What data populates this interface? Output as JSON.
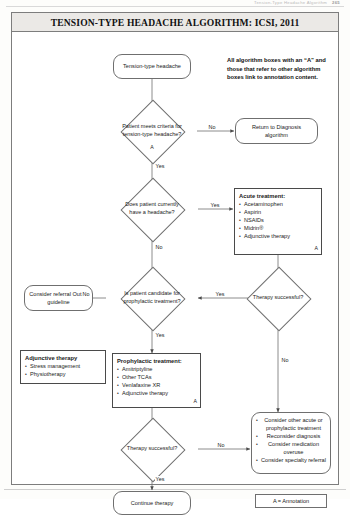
{
  "running_head": {
    "text": "Tension-Type Headache Algorithm",
    "page": "265"
  },
  "figure": {
    "title": "TENSION-TYPE HEADACHE ALGORITHM: ICSI, 2011",
    "note": "All algorithm boxes with an “A” and those that refer to other algorithm boxes link to annotation content.",
    "legend": "A = Annotation"
  },
  "nodes": {
    "start": {
      "label": "Tension-type headache"
    },
    "criteria": {
      "label": "Patient meets criteria for tension-type headache?",
      "annotation": "A"
    },
    "return_diagnosis": {
      "label": "Return to Diagnosis algorithm"
    },
    "current_headache": {
      "label": "Does patient currently have a headache?"
    },
    "acute_treatment": {
      "title": "Acute treatment:",
      "items": [
        "Acetaminophen",
        "Aspirin",
        "NSAIDs",
        "Midrin®",
        "Adjunctive therapy"
      ],
      "annotation": "A"
    },
    "therapy_success_upper": {
      "label": "Therapy successful?"
    },
    "prophylactic_candidate": {
      "label": "Is patient candidate for prophylactic treatment?"
    },
    "consider_referral": {
      "label": "Consider referral Out of guideline"
    },
    "adjunctive_therapy": {
      "title": "Adjunctive therapy",
      "items": [
        "Stress management",
        "Physiotherapy"
      ]
    },
    "prophylactic_treatment": {
      "title": "Prophylactic treatment:",
      "items": [
        "Amitriptyline",
        "Other TCAs",
        "Venlafaxine XR",
        "Adjunctive therapy"
      ],
      "annotation": "A"
    },
    "therapy_success_lower": {
      "label": "Therapy successful?"
    },
    "consider_other": {
      "items": [
        "Consider other acute or prophylactic treatment",
        "Reconsider diagnosis",
        "Consider medication overuse",
        "Consider specialty referral"
      ]
    },
    "continue_therapy": {
      "label": "Continue therapy"
    }
  },
  "edges": {
    "criteria_no": "No",
    "criteria_yes": "Yes",
    "current_headache_yes": "Yes",
    "current_headache_no": "No",
    "therapy_upper_yes": "Yes",
    "therapy_upper_no": "No",
    "prophylactic_no": "No",
    "prophylactic_yes": "Yes",
    "therapy_lower_no": "No",
    "therapy_lower_yes": "Yes"
  },
  "colors": {
    "stroke": "#6f6f6f",
    "title_bg": "#ebe9e6",
    "text": "#1a1a1a"
  }
}
